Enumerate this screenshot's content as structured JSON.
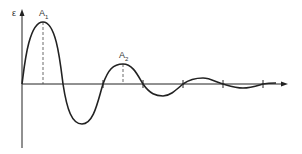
{
  "diagram": {
    "type": "damped-oscillation",
    "y_axis_label": "ε",
    "peak_labels": [
      {
        "base": "A",
        "sub": "1"
      },
      {
        "base": "A",
        "sub": "2"
      }
    ],
    "colors": {
      "stroke": "#222222",
      "background": "#ffffff"
    }
  }
}
